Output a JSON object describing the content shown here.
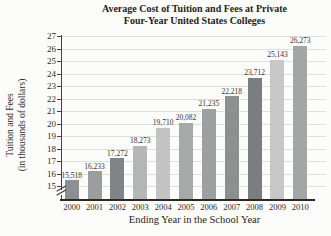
{
  "title_lines": [
    "Average Cost of Tuition and Fees at Private",
    "Four-Year United States Colleges"
  ],
  "chart_data": {
    "type": "bar",
    "title": "Average Cost of Tuition and Fees at Private Four-Year United States Colleges",
    "xlabel": "Ending Year in the School Year",
    "ylabel": "Tuition and Fees (in thousands of dollars)",
    "ylabel_lines": [
      "Tuition and Fees",
      "(in thousands of dollars)"
    ],
    "categories": [
      "2000",
      "2001",
      "2002",
      "2003",
      "2004",
      "2005",
      "2006",
      "2007",
      "2008",
      "2009",
      "2010"
    ],
    "values": [
      15518,
      16233,
      17272,
      18273,
      19710,
      20082,
      21235,
      22218,
      23712,
      25143,
      26273
    ],
    "value_labels": [
      "15,518",
      "16,233",
      "17,272",
      "18,273",
      "19,710",
      "20,082",
      "21,235",
      "22,218",
      "23,712",
      "25,143",
      "26,273"
    ],
    "bar_colors": [
      "#8d8f90",
      "#9c9e9e",
      "#818486",
      "#b5b6b6",
      "#c2c3c2",
      "#a7a8a8",
      "#9da0a0",
      "#8d9091",
      "#7b7e80",
      "#c6c7c6",
      "#a4a6a6"
    ],
    "y_ticks": [
      15,
      16,
      17,
      18,
      19,
      20,
      21,
      22,
      23,
      24,
      25,
      26,
      27
    ],
    "y_unit": "thousands of dollars",
    "ylim": [
      14,
      27.5
    ],
    "grid": "horizontal",
    "axis_break": true,
    "legend": null
  }
}
